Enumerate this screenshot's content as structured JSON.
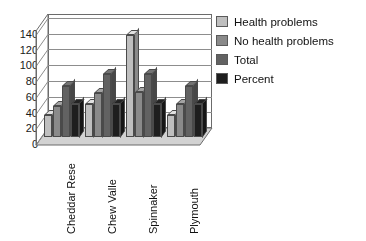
{
  "chart_data": {
    "type": "bar",
    "title": "",
    "subtitle": "",
    "xlabel": "",
    "ylabel": "",
    "categories": [
      "Cheddar Rese",
      "Chew Valle",
      "Spinnaker",
      "Plymouth"
    ],
    "series": [
      {
        "name": "Health problems",
        "values": [
          28,
          43,
          130,
          28
        ],
        "color": "#bfbfbf"
      },
      {
        "name": "No health problems",
        "values": [
          40,
          57,
          58,
          42
        ],
        "color": "#8a8a8a"
      },
      {
        "name": "Total",
        "values": [
          65,
          80,
          80,
          65
        ],
        "color": "#626262"
      },
      {
        "name": "Percent",
        "values": [
          43,
          43,
          43,
          43
        ],
        "color": "#1e1e1e"
      }
    ],
    "yticks": [
      0,
      20,
      40,
      60,
      80,
      100,
      120,
      140
    ],
    "ylim": [
      0,
      145
    ],
    "grid": true,
    "legend_position": "right",
    "threed": true
  },
  "legend": {
    "items": [
      {
        "label": "Health problems"
      },
      {
        "label": "No health problems"
      },
      {
        "label": "Total"
      },
      {
        "label": "Percent"
      }
    ]
  },
  "axis": {
    "y_tick_labels": [
      "140",
      "120",
      "100",
      "80",
      "60",
      "40",
      "20",
      "0"
    ],
    "x_tick_labels": [
      "Cheddar Rese",
      "Chew Valle",
      "Spinnaker",
      "Plymouth"
    ]
  },
  "colors": {
    "series_1": "#bfbfbf",
    "series_2": "#8a8a8a",
    "series_3": "#626262",
    "series_4": "#1e1e1e",
    "plot_background": "#ffffff",
    "wall": "#d2d2d2",
    "gridline": "#8d8d8d",
    "axis_text": "#1a1a1a"
  }
}
